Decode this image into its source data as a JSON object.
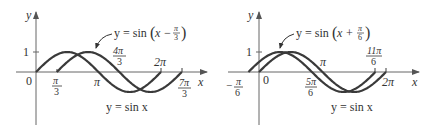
{
  "chart_data": [
    {
      "type": "line",
      "title": "",
      "xlabel": "x",
      "ylabel": "y",
      "ylim": [
        -1,
        1
      ],
      "y_ticks": [
        "1"
      ],
      "x_tick_labels": [
        "0",
        "π/3",
        "π",
        "4π/3",
        "2π",
        "7π/3"
      ],
      "series": [
        {
          "name": "y = sin x",
          "domain": [
            "0",
            "2π"
          ],
          "function": "sin(x)"
        },
        {
          "name": "y = sin(x − π/3)",
          "domain": [
            "π/3",
            "7π/3"
          ],
          "function": "sin(x - π/3)"
        }
      ],
      "annotations": [
        "y = sin(x − π/3)",
        "y = sin x"
      ]
    },
    {
      "type": "line",
      "title": "",
      "xlabel": "x",
      "ylabel": "y",
      "ylim": [
        -1,
        1
      ],
      "y_ticks": [
        "1"
      ],
      "x_tick_labels": [
        "−π/6",
        "0",
        "5π/6",
        "π",
        "11π/6",
        "2π"
      ],
      "series": [
        {
          "name": "y = sin x",
          "domain": [
            "0",
            "2π"
          ],
          "function": "sin(x)"
        },
        {
          "name": "y = sin(x + π/6)",
          "domain": [
            "−π/6",
            "11π/6"
          ],
          "function": "sin(x + π/6)"
        }
      ],
      "annotations": [
        "y = sin(x + π/6)",
        "y = sin x"
      ]
    }
  ],
  "left": {
    "y_axis": "y",
    "x_axis": "x",
    "one": "1",
    "zero": "0",
    "pi": "π",
    "two_pi": "2π",
    "pi3_num": "π",
    "pi3_den": "3",
    "four_pi3_num": "4π",
    "four_pi3_den": "3",
    "seven_pi3_num": "7π",
    "seven_pi3_den": "3",
    "shifted_label_pre": "y = sin",
    "shifted_label_x": "x −",
    "shifted_num": "π",
    "shifted_den": "3",
    "base_label": "y = sin x"
  },
  "right": {
    "y_axis": "y",
    "x_axis": "x",
    "one": "1",
    "zero": "0",
    "pi": "π",
    "two_pi": "2π",
    "neg_pi6_sign": "−",
    "neg_pi6_num": "π",
    "neg_pi6_den": "6",
    "five_pi6_num": "5π",
    "five_pi6_den": "6",
    "eleven_pi6_num": "11π",
    "eleven_pi6_den": "6",
    "shifted_label_pre": "y = sin",
    "shifted_label_x": "x +",
    "shifted_num": "π",
    "shifted_den": "6",
    "base_label": "y = sin x"
  },
  "colors": {
    "curve": "#3a3a3a",
    "axis": "#555555",
    "text": "#333333"
  }
}
